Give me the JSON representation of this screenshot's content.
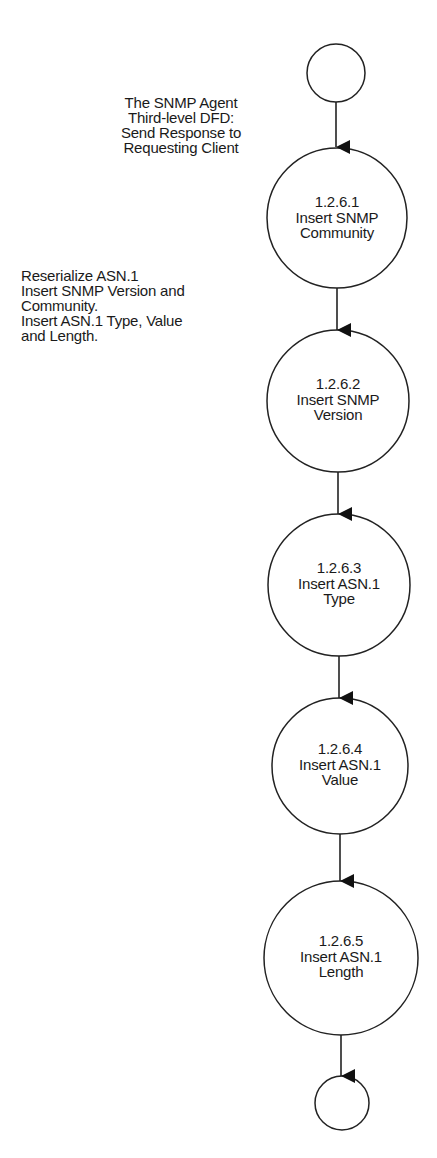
{
  "diagram": {
    "title": {
      "lines": [
        "The SNMP Agent",
        "Third-level DFD:",
        "Send Response to",
        "Requesting Client"
      ]
    },
    "annotation": {
      "lines": [
        "Reserialize ASN.1",
        "Insert SNMP Version and",
        "Community.",
        "Insert ASN.1 Type, Value",
        "and Length."
      ]
    },
    "start_terminal": {
      "label": ""
    },
    "end_terminal": {
      "label": ""
    },
    "processes": [
      {
        "id": "1.2.6.1",
        "lines": [
          "1.2.6.1",
          "Insert SNMP",
          "Community"
        ]
      },
      {
        "id": "1.2.6.2",
        "lines": [
          "1.2.6.2",
          "Insert SNMP",
          "Version"
        ]
      },
      {
        "id": "1.2.6.3",
        "lines": [
          "1.2.6.3",
          "Insert ASN.1",
          "Type"
        ]
      },
      {
        "id": "1.2.6.4",
        "lines": [
          "1.2.6.4",
          "Insert ASN.1",
          "Value"
        ]
      },
      {
        "id": "1.2.6.5",
        "lines": [
          "1.2.6.5",
          "Insert ASN.1",
          "Length"
        ]
      }
    ],
    "flows": [
      {
        "from": "start",
        "to": "1.2.6.1"
      },
      {
        "from": "1.2.6.1",
        "to": "1.2.6.2"
      },
      {
        "from": "1.2.6.2",
        "to": "1.2.6.3"
      },
      {
        "from": "1.2.6.3",
        "to": "1.2.6.4"
      },
      {
        "from": "1.2.6.4",
        "to": "1.2.6.5"
      },
      {
        "from": "1.2.6.5",
        "to": "end"
      }
    ],
    "colors": {
      "stroke": "#1a1a1a",
      "background": "#ffffff"
    }
  }
}
